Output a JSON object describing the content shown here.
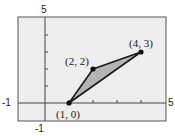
{
  "figure": {
    "type": "coordinate-plane-triangle",
    "window": {
      "xmin": -1,
      "xmax": 5,
      "ymin": -1,
      "ymax": 5
    },
    "axis_labels": {
      "y_top": "5",
      "x_left": "-1",
      "x_right": "5",
      "y_bottom": "-1"
    },
    "points": [
      {
        "label": "(1, 0)",
        "x": 1,
        "y": 0
      },
      {
        "label": "(2, 2)",
        "x": 2,
        "y": 2
      },
      {
        "label": "(4, 3)",
        "x": 4,
        "y": 3
      }
    ],
    "colors": {
      "plot_background": "#eeeeee",
      "frame": "#555555",
      "axes": "#444444",
      "triangle_fill": "#b5b5b5",
      "triangle_stroke": "#1a1a1a",
      "point": "#111111"
    }
  }
}
